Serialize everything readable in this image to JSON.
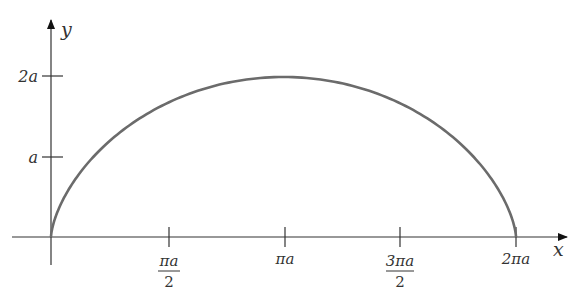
{
  "chart_data": {
    "type": "line",
    "title": "",
    "xlabel": "x",
    "ylabel": "y",
    "curve": "cycloid",
    "parametric": {
      "x": "a(t - sin t)",
      "y": "a(1 - cos t)",
      "t_range": [
        0,
        6.2832
      ]
    },
    "x_ticks": [
      {
        "value": 1.5708,
        "label_num": "πa",
        "label_den": "2"
      },
      {
        "value": 3.1416,
        "label": "πa"
      },
      {
        "value": 4.7124,
        "label_num": "3πa",
        "label_den": "2"
      },
      {
        "value": 6.2832,
        "label": "2πa"
      }
    ],
    "y_ticks": [
      {
        "value": 1,
        "label": "a"
      },
      {
        "value": 2,
        "label": "2a"
      }
    ],
    "xlim": [
      0,
      6.2832
    ],
    "ylim": [
      0,
      2
    ],
    "points": [
      {
        "x": 0,
        "y": 0
      },
      {
        "x": 3.1416,
        "y": 2
      },
      {
        "x": 6.2832,
        "y": 0
      }
    ],
    "grid": false,
    "legend": null,
    "color": "#6b6b6b"
  },
  "labels": {
    "x_axis": "x",
    "y_axis": "y",
    "tick_pi_half_num": "πa",
    "tick_pi_half_den": "2",
    "tick_pi": "πa",
    "tick_3pi_half_num": "3πa",
    "tick_3pi_half_den": "2",
    "tick_2pi": "2πa",
    "tick_a": "a",
    "tick_2a": "2a"
  }
}
